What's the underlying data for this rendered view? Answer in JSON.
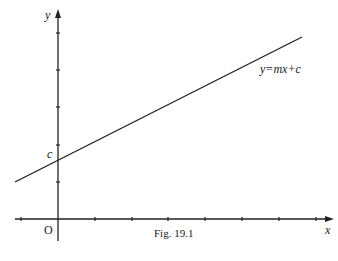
{
  "figure": {
    "caption": "Fig. 19.1",
    "axes": {
      "x_label": "x",
      "y_label": "y",
      "origin_label": "O"
    },
    "line": {
      "equation": "y=mx+c",
      "intercept_label": "c"
    }
  }
}
